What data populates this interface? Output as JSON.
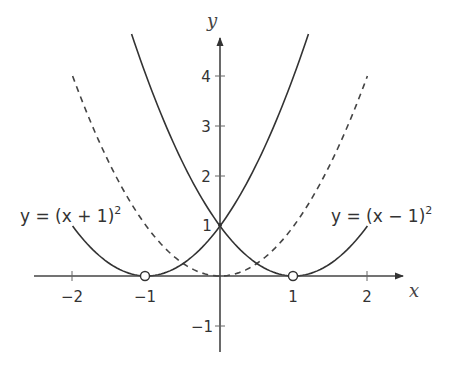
{
  "chart_data": {
    "type": "line",
    "title": "",
    "xlabel": "x",
    "ylabel": "y",
    "xlim": [
      -2.5,
      2.5
    ],
    "ylim": [
      -1.5,
      4.8
    ],
    "grid": false,
    "x_ticks": [
      -2,
      -1,
      1,
      2
    ],
    "x_tick_labels": [
      "−2",
      "−1",
      "1",
      "2"
    ],
    "y_ticks": [
      -1,
      1,
      2,
      3,
      4
    ],
    "y_tick_labels": [
      "−1",
      "1",
      "2",
      "3",
      "4"
    ],
    "series": [
      {
        "name": "y = (x + 1)²",
        "style": "solid",
        "formula": "(x+1)^2",
        "x_range": [
          -2,
          1.2
        ],
        "points": [
          [
            -2,
            1
          ],
          [
            -1.5,
            0.25
          ],
          [
            -1,
            0
          ],
          [
            -0.5,
            0.25
          ],
          [
            0,
            1
          ],
          [
            0.5,
            2.25
          ],
          [
            1,
            4
          ],
          [
            1.2,
            4.84
          ]
        ]
      },
      {
        "name": "y = (x − 1)²",
        "style": "solid",
        "formula": "(x-1)^2",
        "x_range": [
          -1.2,
          2
        ],
        "points": [
          [
            -1.2,
            4.84
          ],
          [
            -1,
            4
          ],
          [
            -0.5,
            2.25
          ],
          [
            0,
            1
          ],
          [
            0.5,
            0.25
          ],
          [
            1,
            0
          ],
          [
            1.5,
            0.25
          ],
          [
            2,
            1
          ]
        ]
      },
      {
        "name": "y = x²",
        "style": "dashed",
        "formula": "x^2",
        "x_range": [
          -2,
          2
        ],
        "points": [
          [
            -2,
            4
          ],
          [
            -1.5,
            2.25
          ],
          [
            -1,
            1
          ],
          [
            -0.5,
            0.25
          ],
          [
            0,
            0
          ],
          [
            0.5,
            0.25
          ],
          [
            1,
            1
          ],
          [
            1.5,
            2.25
          ],
          [
            2,
            4
          ]
        ]
      }
    ],
    "annotations": [
      {
        "text": "y = (x + 1)²",
        "near": [
          -2,
          1
        ]
      },
      {
        "text": "y = (x − 1)²",
        "near": [
          2,
          1
        ]
      },
      {
        "type": "open-circle",
        "at": [
          -1,
          0
        ]
      },
      {
        "type": "open-circle",
        "at": [
          1,
          0
        ]
      },
      {
        "text": "1",
        "at": [
          0,
          1
        ],
        "note": "intersection label"
      }
    ],
    "legend": "none (curves labeled directly)"
  },
  "labels": {
    "x_axis": "x",
    "y_axis": "y",
    "eq_left_main": "y = (x + 1)",
    "eq_left_sup": "2",
    "eq_right_main": "y = (x − 1)",
    "eq_right_sup": "2",
    "xt": [
      "−2",
      "−1",
      "1",
      "2"
    ],
    "yt": [
      "4",
      "3",
      "2",
      "1",
      "−1"
    ]
  },
  "colors": {
    "axis": "#444444",
    "curve": "#333333",
    "dashed": "#444444"
  }
}
